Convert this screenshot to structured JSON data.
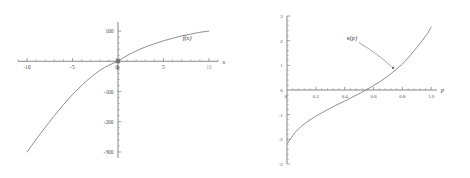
{
  "figure": {
    "panel_count": 2,
    "background_color": "#ffffff",
    "curve_color": "#7a7a7a",
    "axis_color": "#555555",
    "text_color": "#3d3d3d"
  },
  "chart_data": [
    {
      "id": "left-plot",
      "type": "line",
      "title": "",
      "xlabel": "x",
      "ylabel": "",
      "curve_label": "f(x)",
      "xlim": [
        -11,
        11
      ],
      "ylim": [
        -320,
        130
      ],
      "grid": false,
      "legend_position": "inline-right",
      "xticks": [
        -10,
        -5,
        0,
        5,
        10
      ],
      "xtick_labels": [
        "-10",
        "-5",
        "0",
        "5",
        "10"
      ],
      "xtick_labels_shown": [
        "-10",
        "-5",
        "0",
        "5"
      ],
      "yticks": [
        100,
        0,
        -100,
        -200,
        -300
      ],
      "ytick_labels": [
        "100",
        "0",
        "-100",
        "-200",
        "-300"
      ],
      "minor_tick_spacing_x": 1,
      "minor_tick_spacing_y": 20,
      "x": [
        -10,
        -9.5,
        -9,
        -8.5,
        -8,
        -7.5,
        -7,
        -6.5,
        -6,
        -5.5,
        -5,
        -4.5,
        -4,
        -3.5,
        -3,
        -2.5,
        -2,
        -1.5,
        -1,
        -0.5,
        0,
        0.5,
        1,
        1.5,
        2,
        2.5,
        3,
        3.5,
        4,
        4.5,
        5,
        5.5,
        6,
        6.5,
        7,
        7.5,
        8,
        8.5,
        9,
        9.5,
        10
      ],
      "y": [
        -300,
        -279,
        -258,
        -238,
        -218,
        -199,
        -180,
        -162,
        -144,
        -127,
        -110,
        -95,
        -80,
        -66,
        -53,
        -41,
        -30,
        -21,
        -13,
        -6,
        0,
        10,
        19,
        27,
        34,
        41,
        47,
        53,
        58,
        63,
        68,
        72,
        76,
        80,
        84,
        87,
        90,
        93,
        96,
        98,
        100
      ],
      "annotations": [
        {
          "text": "f(x)",
          "x": 7.6,
          "y": 72,
          "style": "italic"
        }
      ]
    },
    {
      "id": "right-plot",
      "type": "line",
      "title": "",
      "xlabel": "p",
      "ylabel": "",
      "curve_label": "κ(p)",
      "xlim": [
        0,
        1.04
      ],
      "ylim": [
        -3,
        3
      ],
      "grid": false,
      "legend_position": "annotation-with-arrow",
      "xticks": [
        0,
        0.2,
        0.4,
        0.6,
        0.8,
        1.0
      ],
      "xtick_labels": [
        "0",
        "0.2",
        "0.4",
        "0.6",
        "0.8",
        "1.0"
      ],
      "yticks": [
        3,
        2,
        1,
        0,
        -1,
        -2,
        -3
      ],
      "ytick_labels": [
        "3",
        "2",
        "1",
        "0",
        "-1",
        "-2",
        "-3"
      ],
      "minor_tick_spacing_x": 0.04,
      "minor_tick_spacing_y": 0.2,
      "x": [
        0.005,
        0.02,
        0.04,
        0.06,
        0.08,
        0.1,
        0.13,
        0.16,
        0.2,
        0.24,
        0.28,
        0.32,
        0.36,
        0.4,
        0.44,
        0.48,
        0.52,
        0.56,
        0.6,
        0.64,
        0.68,
        0.72,
        0.76,
        0.8,
        0.84,
        0.88,
        0.91,
        0.94,
        0.96,
        0.975,
        0.985,
        0.993,
        0.998
      ],
      "y": [
        -2.15,
        -2.02,
        -1.85,
        -1.7,
        -1.58,
        -1.47,
        -1.33,
        -1.21,
        -1.06,
        -0.93,
        -0.8,
        -0.68,
        -0.56,
        -0.45,
        -0.33,
        -0.21,
        -0.09,
        0.04,
        0.18,
        0.32,
        0.48,
        0.66,
        0.85,
        1.05,
        1.3,
        1.58,
        1.8,
        2.02,
        2.18,
        2.3,
        2.4,
        2.48,
        2.55
      ],
      "annotations": [
        {
          "text": "κ(p)",
          "x": 0.45,
          "y": 2.02,
          "style": "italic",
          "arrow_to_x": 0.735,
          "arrow_to_y": 0.9,
          "marker": true
        }
      ]
    }
  ]
}
